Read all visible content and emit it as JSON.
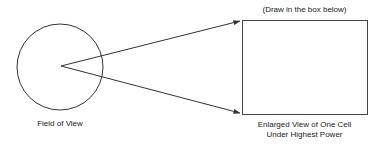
{
  "diagram": {
    "field_of_view": {
      "label": "Field of View",
      "circle": {
        "cx": 60,
        "cy": 67,
        "r": 43
      }
    },
    "drawing_box": {
      "instruction": "(Draw in the box below)",
      "rect": {
        "x": 242,
        "y": 20,
        "width": 125,
        "height": 94
      },
      "label_line1": "Enlarged View of One Cell",
      "label_line2": "Under Highest Power"
    },
    "arrows": [
      {
        "from": [
          61,
          66
        ],
        "to": [
          240,
          21
        ]
      },
      {
        "from": [
          61,
          66
        ],
        "to": [
          240,
          113
        ]
      }
    ],
    "colors": {
      "stroke": "#333333",
      "text": "#222222",
      "background": "#ffffff"
    }
  }
}
